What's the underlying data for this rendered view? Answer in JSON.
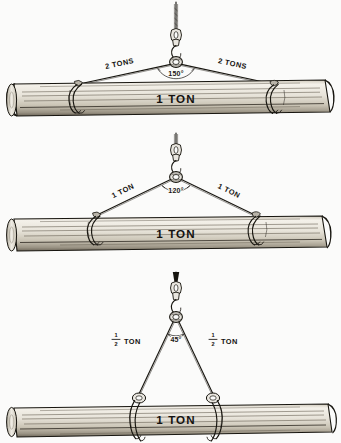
{
  "figure": {
    "load_label": "1 TON",
    "caption": ""
  },
  "colors": {
    "ink": "#17150f",
    "paper": "#fbfbfa",
    "log_light": "#f2efe8",
    "log_mid": "#d9d4c8",
    "log_dark": "#8d8678",
    "metal": "#e9e6df"
  },
  "panels": [
    {
      "id": "panel-150",
      "angle_label": "150°",
      "leg_left_label": "2 TONS",
      "leg_right_label": "2 TONS",
      "load_label": "1 TON",
      "hitch_type": "rope-choker",
      "angle_degrees": 150,
      "leg_tension_tons": 2,
      "load_tons": 1
    },
    {
      "id": "panel-120",
      "angle_label": "120°",
      "leg_left_label": "1 TON",
      "leg_right_label": "1 TON",
      "load_label": "1 TON",
      "hitch_type": "rope-choker",
      "angle_degrees": 120,
      "leg_tension_tons": 1,
      "load_tons": 1
    },
    {
      "id": "panel-45",
      "angle_label": "45°",
      "leg_left_numerator": "1",
      "leg_left_denominator": "2",
      "leg_left_unit": "TON",
      "leg_right_numerator": "1",
      "leg_right_denominator": "2",
      "leg_right_unit": "TON",
      "load_label": "1 TON",
      "hitch_type": "shackle-choker",
      "angle_degrees": 45,
      "leg_tension_tons": 0.5,
      "load_tons": 1
    }
  ]
}
